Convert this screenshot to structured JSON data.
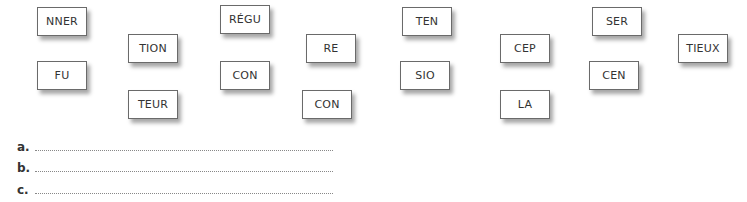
{
  "tiles": [
    {
      "text": "NNER",
      "x": 37,
      "y": 7
    },
    {
      "text": "FU",
      "x": 37,
      "y": 61
    },
    {
      "text": "TION",
      "x": 128,
      "y": 34
    },
    {
      "text": "TEUR",
      "x": 128,
      "y": 90
    },
    {
      "text": "RÉGU",
      "x": 220,
      "y": 5
    },
    {
      "text": "CON",
      "x": 220,
      "y": 61
    },
    {
      "text": "RE",
      "x": 306,
      "y": 34
    },
    {
      "text": "CON",
      "x": 302,
      "y": 90
    },
    {
      "text": "TEN",
      "x": 402,
      "y": 7
    },
    {
      "text": "SIO",
      "x": 400,
      "y": 61
    },
    {
      "text": "CEP",
      "x": 500,
      "y": 34
    },
    {
      "text": "LA",
      "x": 500,
      "y": 90
    },
    {
      "text": "SER",
      "x": 592,
      "y": 7
    },
    {
      "text": "CEN",
      "x": 589,
      "y": 61
    },
    {
      "text": "TIEUX",
      "x": 678,
      "y": 34
    }
  ],
  "answer_lines": [
    {
      "label": "a.",
      "value": "",
      "y": 138
    },
    {
      "label": "b.",
      "value": "",
      "y": 159
    },
    {
      "label": "c.",
      "value": "",
      "y": 181
    }
  ]
}
